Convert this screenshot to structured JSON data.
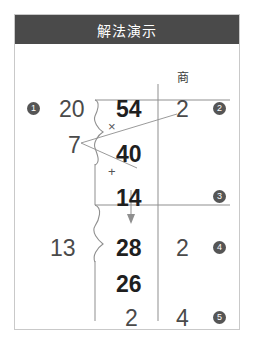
{
  "header": {
    "title": "解法演示"
  },
  "labels": {
    "quotient_header": "商"
  },
  "operators": {
    "multiply": "×",
    "plus": "+"
  },
  "badges": [
    {
      "id": "1",
      "label": "1"
    },
    {
      "id": "2",
      "label": "2"
    },
    {
      "id": "3",
      "label": "3"
    },
    {
      "id": "4",
      "label": "4"
    },
    {
      "id": "5",
      "label": "5"
    }
  ],
  "division": {
    "trial_divisor": "20",
    "adjust_value": "7",
    "actual_divisor": "13",
    "dividend": "54",
    "product": "40",
    "first_remainder": "14",
    "brought_down": "28",
    "second_product": "26",
    "final_remainder": "2",
    "quotient_first": "2",
    "quotient_second": "2",
    "quotient_third": "4"
  },
  "colors": {
    "header_bg": "#4a4a4a",
    "header_text": "#ffffff",
    "card_border": "#c9c9c9",
    "rule": "#8f8f8f",
    "badge_bg": "#555555",
    "digit_gray": "#4a4a4a",
    "digit_dark": "#1f1f1f"
  }
}
